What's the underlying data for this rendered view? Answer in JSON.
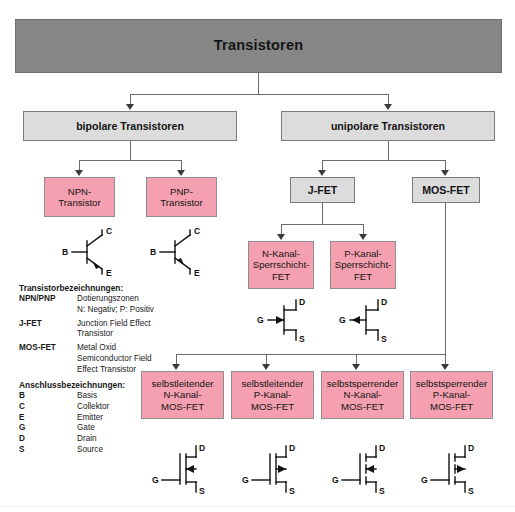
{
  "title": "Transistoren",
  "colors": {
    "root_box": "#868686",
    "grey_box": "#dcdcdc",
    "pink_box": "#f4a0b0",
    "line": "#6b6b6b",
    "text": "#141414"
  },
  "level2": [
    {
      "label": "bipolare Transistoren"
    },
    {
      "label": "unipolare Transistoren"
    }
  ],
  "bipolar_children": [
    {
      "line1": "NPN-",
      "line2": "Transistor"
    },
    {
      "line1": "PNP-",
      "line2": "Transistor"
    }
  ],
  "unipolar_children": [
    {
      "label": "J-FET"
    },
    {
      "label": "MOS-FET"
    }
  ],
  "jfet_children": [
    {
      "line1": "N-Kanal-",
      "line2": "Sperrschicht-",
      "line3": "FET"
    },
    {
      "line1": "P-Kanal-",
      "line2": "Sperrschicht-",
      "line3": "FET"
    }
  ],
  "mosfet_children": [
    {
      "line1": "selbstleitender",
      "line2": "N-Kanal-",
      "line3": "MOS-FET"
    },
    {
      "line1": "selbstleitender",
      "line2": "P-Kanal-",
      "line3": "MOS-FET"
    },
    {
      "line1": "selbstsperrender",
      "line2": "N-Kanal-",
      "line3": "MOS-FET"
    },
    {
      "line1": "selbstsperrender",
      "line2": "P-Kanal-",
      "line3": "MOS-FET"
    }
  ],
  "legend_names": {
    "heading": "Transistorbezeichnungen:",
    "rows": [
      {
        "key": "NPN/PNP",
        "v1": "Dotierungszonen",
        "v2": "N: Negativ; P: Positiv",
        "v3": ""
      },
      {
        "key": "J-FET",
        "v1": "Junction Field Effect",
        "v2": "Transistor",
        "v3": ""
      },
      {
        "key": "MOS-FET",
        "v1": "Metal Oxid",
        "v2": "Semiconductor Field",
        "v3": "Effect Transistor"
      }
    ]
  },
  "legend_pins": {
    "heading": "Anschlussbezeichnungen:",
    "rows": [
      {
        "key": "B",
        "v1": "Basis"
      },
      {
        "key": "C",
        "v1": "Collektor"
      },
      {
        "key": "E",
        "v1": "Emitter"
      },
      {
        "key": "G",
        "v1": "Gate"
      },
      {
        "key": "D",
        "v1": "Drain"
      },
      {
        "key": "S",
        "v1": "Source"
      }
    ]
  },
  "symbols": {
    "bjt": [
      {
        "name": "npn-transistor-symbol",
        "base": "B",
        "collector": "C",
        "emitter": "E"
      },
      {
        "name": "pnp-transistor-symbol",
        "base": "B",
        "collector": "C",
        "emitter": "E"
      }
    ],
    "jfet": [
      {
        "name": "n-channel-jfet-symbol",
        "gate": "G",
        "drain": "D",
        "source": "S"
      },
      {
        "name": "p-channel-jfet-symbol",
        "gate": "G",
        "drain": "D",
        "source": "S"
      }
    ],
    "mosfet": [
      {
        "name": "n-channel-depletion-mosfet-symbol",
        "gate": "G",
        "drain": "D",
        "source": "S"
      },
      {
        "name": "p-channel-depletion-mosfet-symbol",
        "gate": "G",
        "drain": "D",
        "source": "S"
      },
      {
        "name": "n-channel-enhancement-mosfet-symbol",
        "gate": "G",
        "drain": "D",
        "source": "S"
      },
      {
        "name": "p-channel-enhancement-mosfet-symbol",
        "gate": "G",
        "drain": "D",
        "source": "S"
      }
    ]
  }
}
